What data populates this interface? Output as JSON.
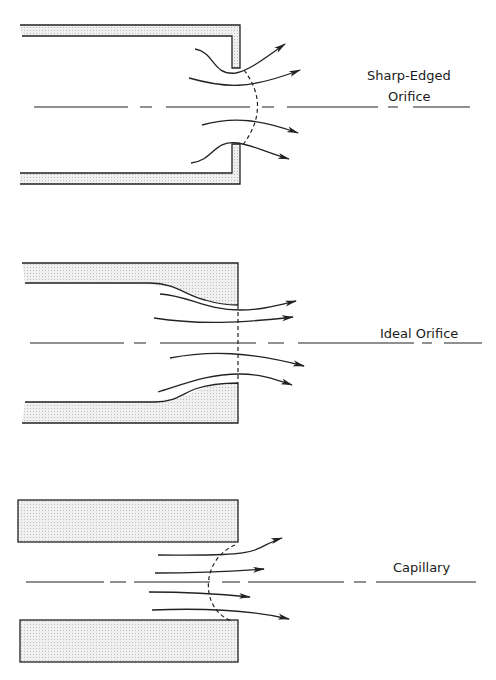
{
  "figure": {
    "panels": [
      {
        "id": "sharp-edged",
        "label_line1": "Sharp-Edged",
        "label_line2": "Orifice"
      },
      {
        "id": "ideal",
        "label": "Ideal Orifice"
      },
      {
        "id": "capillary",
        "label": "Capillary"
      }
    ],
    "colors": {
      "line": "#222222",
      "fill_stipple": "#e4e4e4",
      "background": "#ffffff"
    }
  }
}
